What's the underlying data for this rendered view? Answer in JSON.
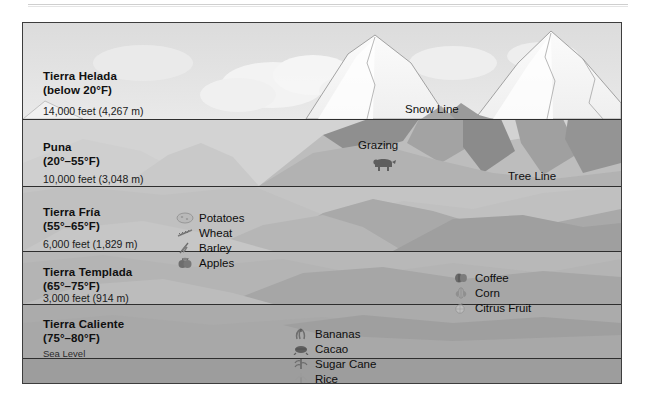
{
  "diagram": {
    "type": "elevation-zone-diagram",
    "frame": {
      "x": 22,
      "y": 22,
      "width": 598,
      "height": 360
    },
    "background_color": "#d9d9d9",
    "border_color": "#3d3d3d"
  },
  "zones": [
    {
      "id": "tierra-helada",
      "name": "Tierra Helada",
      "temperature": "(below 20°F)",
      "elevation_label": "14,000 feet (4,267 m)",
      "band_color": "#e6e6e6",
      "top": 0,
      "bottom": 96
    },
    {
      "id": "puna",
      "name": "Puna",
      "temperature": "(20°–55°F)",
      "elevation_label": "10,000 feet (3,048 m)",
      "band_color": "#d2d2d2",
      "top": 96,
      "bottom": 163
    },
    {
      "id": "tierra-fria",
      "name": "Tierra Fría",
      "temperature": "(55°–65°F)",
      "elevation_label": "6,000 feet (1,829 m)",
      "band_color": "#c2c2c2",
      "top": 163,
      "bottom": 228
    },
    {
      "id": "tierra-templada",
      "name": "Tierra Templada",
      "temperature": "(65°–75°F)",
      "elevation_label": "3,000 feet (914 m)",
      "band_color": "#b5b5b5",
      "top": 228,
      "bottom": 281
    },
    {
      "id": "tierra-caliente",
      "name": "Tierra Caliente",
      "temperature": "(75°–80°F)",
      "elevation_label": "Sea Level",
      "band_color": "#a9a9a9",
      "top": 281,
      "bottom": 335
    }
  ],
  "boundary_lines": [
    {
      "name": "snow-line",
      "label": "Snow Line",
      "y": 96
    },
    {
      "name": "tree-line",
      "label": "Tree Line",
      "y": 163
    },
    {
      "name": "six-thousand-line",
      "label": "",
      "y": 228
    },
    {
      "name": "three-thousand-line",
      "label": "",
      "y": 281
    },
    {
      "name": "sea-level-line",
      "label": "",
      "y": 335
    }
  ],
  "annotations": {
    "snow_line": "Snow Line",
    "tree_line": "Tree Line",
    "grazing": "Grazing"
  },
  "crops": {
    "tierra_fria": [
      {
        "name": "Potatoes",
        "icon": "potato-icon"
      },
      {
        "name": "Wheat",
        "icon": "wheat-icon"
      },
      {
        "name": "Barley",
        "icon": "barley-icon"
      },
      {
        "name": "Apples",
        "icon": "apple-icon"
      }
    ],
    "tierra_templada": [
      {
        "name": "Coffee",
        "icon": "coffee-icon"
      },
      {
        "name": "Corn",
        "icon": "corn-icon"
      },
      {
        "name": "Citrus Fruit",
        "icon": "citrus-icon"
      }
    ],
    "tierra_caliente": [
      {
        "name": "Bananas",
        "icon": "banana-icon"
      },
      {
        "name": "Cacao",
        "icon": "cacao-icon"
      },
      {
        "name": "Sugar Cane",
        "icon": "sugarcane-icon"
      },
      {
        "name": "Rice",
        "icon": "rice-icon"
      }
    ]
  },
  "livestock": {
    "name": "grazing-sheep-icon",
    "label": "Grazing"
  }
}
